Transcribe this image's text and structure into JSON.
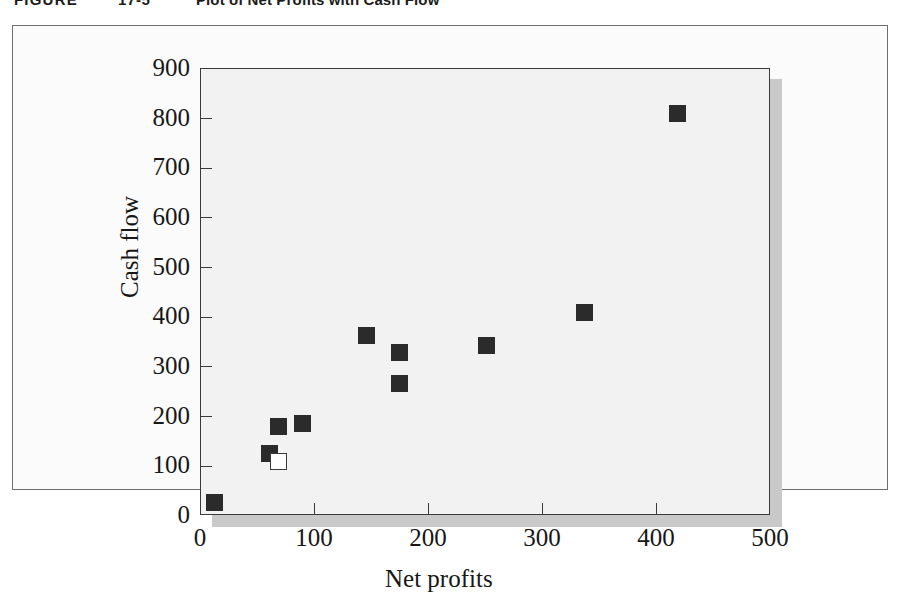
{
  "caption": {
    "label": "FIGURE",
    "number": "17-5",
    "title": "Plot of Net Profits with Cash Flow"
  },
  "chart_data": {
    "type": "scatter",
    "title": "Plot of Net Profits with Cash Flow",
    "xlabel": "Net profits",
    "ylabel": "Cash flow",
    "xlim": [
      0,
      500
    ],
    "ylim": [
      0,
      900
    ],
    "xticks": [
      0,
      100,
      200,
      300,
      400,
      500
    ],
    "yticks": [
      0,
      100,
      200,
      300,
      400,
      500,
      600,
      700,
      800,
      900
    ],
    "xtick_labels": [
      "0",
      "100",
      "200",
      "300",
      "400",
      "500"
    ],
    "ytick_labels": [
      "0",
      "100",
      "200",
      "300",
      "400",
      "500",
      "600",
      "700",
      "800",
      "900"
    ],
    "grid": false,
    "legend": false,
    "plot_background": "#f2f2f2",
    "marker_color": "#2b2b2b",
    "series": [
      {
        "name": "Observations",
        "marker": "filled-square",
        "points": [
          {
            "x": 12,
            "y": 28
          },
          {
            "x": 60,
            "y": 125
          },
          {
            "x": 68,
            "y": 181
          },
          {
            "x": 89,
            "y": 187
          },
          {
            "x": 145,
            "y": 364
          },
          {
            "x": 174,
            "y": 330
          },
          {
            "x": 174,
            "y": 266
          },
          {
            "x": 250,
            "y": 344
          },
          {
            "x": 336,
            "y": 410
          },
          {
            "x": 418,
            "y": 811
          }
        ]
      },
      {
        "name": "Highlighted point",
        "marker": "hollow-square",
        "points": [
          {
            "x": 68,
            "y": 109
          }
        ]
      }
    ]
  }
}
